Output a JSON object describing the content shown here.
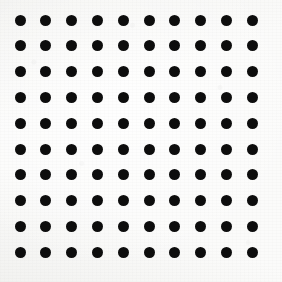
{
  "image": {
    "title": "Polka Dot Pattern",
    "description": "Regular square grid of solid black circular dots on off-white paper",
    "width": 282,
    "height": 282,
    "background_color": "#fbfbfa",
    "texture": "paper-grain"
  },
  "pattern": {
    "name": "polka-dot-grid",
    "shape": "circle",
    "dot_color": "#0d0d0d",
    "dot_diameter": 11,
    "columns": 10,
    "rows": 10,
    "total_dots": 100,
    "spacing_x": 25.8,
    "spacing_y": 25.8,
    "origin_x": 20,
    "origin_y": 20,
    "margin_left": 20,
    "margin_top": 20,
    "margin_right": 24,
    "margin_bottom": 24,
    "alignment": "square",
    "column_centers_x": [
      20,
      45.8,
      71.6,
      97.4,
      123.2,
      149,
      174.8,
      200.6,
      226.4,
      252.2
    ],
    "row_centers_y": [
      20,
      45.8,
      71.6,
      97.4,
      123.2,
      149,
      174.8,
      200.6,
      226.4,
      252.2
    ]
  }
}
